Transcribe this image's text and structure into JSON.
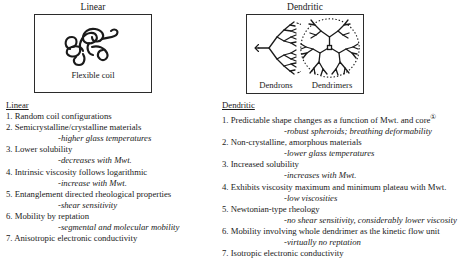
{
  "panels": {
    "left": {
      "title": "Linear",
      "caption": "Flexible coil",
      "art": "random-coil-sketch"
    },
    "right": {
      "title": "Dendritic",
      "caption_left": "Dendrons",
      "caption_right": "Dendrimers",
      "art_left": "dendron-wedge-sketch",
      "art_right": "dendrimer-sphere-sketch"
    }
  },
  "columns": {
    "linear": {
      "heading": "Linear",
      "points": [
        {
          "main": "1. Random coil configurations",
          "sub": ""
        },
        {
          "main": "2. Semicrystalline/crystalline materials",
          "sub": "-higher glass temperatures"
        },
        {
          "main": "3. Lower solubility",
          "sub": "-decreases with Mwt."
        },
        {
          "main": "4. Intrinsic viscosity follows logarithmic",
          "sub": "-increase with Mwt."
        },
        {
          "main": "5. Entanglement directed rheological properties",
          "sub": "-shear sensitivity"
        },
        {
          "main": "6. Mobility by reptation",
          "sub": "-segmental and molecular mobility"
        },
        {
          "main": "7. Anisotropic electronic conductivity",
          "sub": ""
        }
      ]
    },
    "dendritic": {
      "heading": "Dendritic",
      "points": [
        {
          "main": "1. Predictable shape changes as a function of Mwt. and core",
          "mark": "①",
          "sub": "-robust spheroids; breathing deformability"
        },
        {
          "main": "2. Non-crystalline, amorphous materials",
          "sub": "-lower glass temperatures"
        },
        {
          "main": "3. Increased solubility",
          "sub": "-increases with Mwt."
        },
        {
          "main": "4. Exhibits viscosity maximum and minimum plateau with Mwt.",
          "sub": "-low viscosities"
        },
        {
          "main": "5. Newtonian-type rheology",
          "sub": "-no shear sensitivity, considerably lower viscosity"
        },
        {
          "main": "6. Mobility involving whole dendrimer as the kinetic flow unit",
          "sub": "-virtually no reptation"
        },
        {
          "main": "7. Isotropic electronic conductivity",
          "sub": ""
        }
      ]
    }
  },
  "colors": {
    "ink": "#1a1a1a",
    "border": "#2b2b2b",
    "background": "#ffffff"
  }
}
